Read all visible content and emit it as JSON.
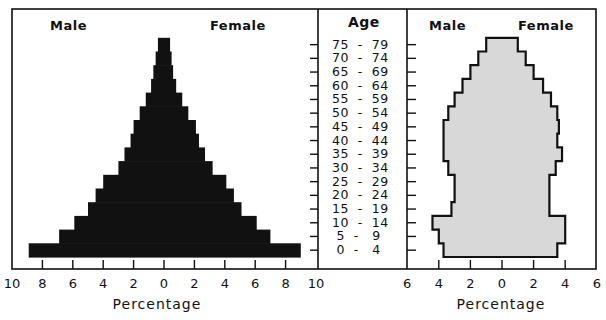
{
  "chart_data": [
    {
      "type": "bar",
      "subtype": "population-pyramid",
      "title": "",
      "legend": [
        "Male",
        "Female"
      ],
      "left_label": "Male",
      "right_label": "Female",
      "xlabel": "Percentage",
      "ylabel": "Age",
      "xlim": [
        -10,
        10
      ],
      "x_ticks": [
        "10",
        "8",
        "6",
        "4",
        "2",
        "0",
        "2",
        "4",
        "6",
        "8",
        "10"
      ],
      "fill_color": "#111111",
      "categories": [
        "0 - 4",
        "5 - 9",
        "10 - 14",
        "15 - 19",
        "20 - 24",
        "25 - 29",
        "30 - 34",
        "35 - 39",
        "40 - 44",
        "45 - 49",
        "50 - 54",
        "55 - 59",
        "60 - 64",
        "65 - 69",
        "70 - 74",
        "75 - 79"
      ],
      "series": [
        {
          "name": "Male",
          "values": [
            8.9,
            6.9,
            5.9,
            5.0,
            4.5,
            4.0,
            3.0,
            2.6,
            2.2,
            2.0,
            1.6,
            1.2,
            0.85,
            0.7,
            0.55,
            0.4
          ]
        },
        {
          "name": "Female",
          "values": [
            9.0,
            7.0,
            6.1,
            5.1,
            4.6,
            4.1,
            3.2,
            2.7,
            2.3,
            2.1,
            1.6,
            1.2,
            0.8,
            0.6,
            0.5,
            0.4
          ]
        }
      ],
      "grid": false
    },
    {
      "type": "bar",
      "subtype": "population-pyramid",
      "title": "",
      "legend": [
        "Male",
        "Female"
      ],
      "left_label": "Male",
      "right_label": "Female",
      "xlabel": "Percentage",
      "ylabel": "Age",
      "xlim": [
        -6,
        6
      ],
      "x_ticks": [
        "6",
        "4",
        "2",
        "0",
        "2",
        "4",
        "6"
      ],
      "fill_color": "#d8d8d8",
      "outline_color": "#111111",
      "categories": [
        "0 - 4",
        "5 - 9",
        "10 - 14",
        "15 - 19",
        "20 - 24",
        "25 - 29",
        "30 - 34",
        "35 - 39",
        "40 - 44",
        "45 - 49",
        "50 - 54",
        "55 - 59",
        "60 - 64",
        "65 - 69",
        "70 - 74",
        "75 - 79"
      ],
      "series": [
        {
          "name": "Male",
          "values": [
            3.7,
            4.0,
            4.4,
            3.2,
            3.0,
            3.0,
            3.4,
            3.7,
            3.7,
            3.7,
            3.4,
            3.0,
            2.5,
            2.0,
            1.5,
            1.0
          ]
        },
        {
          "name": "Female",
          "values": [
            3.5,
            4.0,
            4.0,
            3.0,
            3.0,
            3.0,
            3.4,
            3.8,
            3.5,
            3.6,
            3.5,
            3.1,
            2.6,
            2.0,
            1.5,
            1.0
          ]
        }
      ],
      "grid": false
    }
  ],
  "labels": {
    "age_header": "Age",
    "left_panel": {
      "male": "Male",
      "female": "Female",
      "xlabel": "Percentage"
    },
    "right_panel": {
      "male": "Male",
      "female": "Female",
      "xlabel": "Percentage"
    }
  }
}
